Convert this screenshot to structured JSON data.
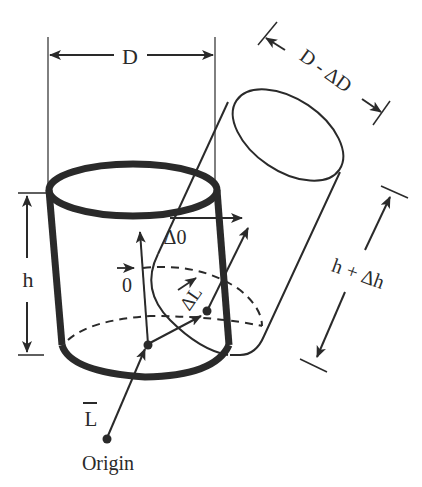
{
  "diagram": {
    "type": "geometric-strain-illustration",
    "labels": {
      "diameter": "D",
      "diameter_deformed": "D - ΔD",
      "height": "h",
      "height_deformed": "h + Δh",
      "delta_theta": "Δ0",
      "theta_vector": "0",
      "delta_L_vector": "ΔL",
      "L_vector": "L",
      "origin": "Origin"
    },
    "shapes": [
      {
        "name": "original-cylinder",
        "style": "thick outline"
      },
      {
        "name": "deformed-cylinder",
        "style": "thin outline, tilted"
      }
    ],
    "colors": {
      "ink": "#2a2a2a",
      "background": "#ffffff"
    }
  }
}
